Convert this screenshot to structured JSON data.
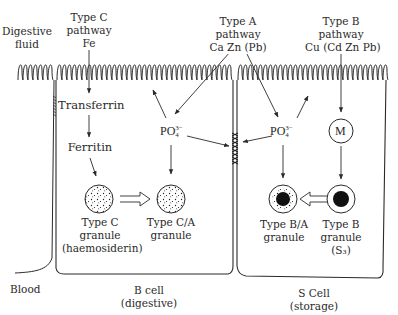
{
  "diagram": {
    "type": "cell-pathway-schematic",
    "labels": {
      "digestive_fluid": [
        "Digestive",
        "fluid"
      ],
      "type_c_pathway": [
        "Type C",
        "pathway",
        "Fe"
      ],
      "type_a_pathway": [
        "Type A",
        "pathway",
        "Ca Zn (Pb)"
      ],
      "type_b_pathway": [
        "Type B",
        "pathway",
        "Cu (Cd Zn Pb)"
      ],
      "transferrin": "Transferrin",
      "ferritin": "Ferritin",
      "phosphate_left": {
        "base": "PO",
        "sup": "3−",
        "sub": "4"
      },
      "phosphate_right": {
        "base": "PO",
        "sup": "3−",
        "sub": "4"
      },
      "metallothionein": "M",
      "type_c_granule": [
        "Type C",
        "granule",
        "(haemosiderin)"
      ],
      "type_ca_granule": [
        "Type C/A",
        "granule"
      ],
      "type_ba_granule": [
        "Type B/A",
        "granule"
      ],
      "type_b_granule": [
        "Type B",
        "granule",
        "(S₃)"
      ],
      "blood": "Blood",
      "b_cell": [
        "B cell",
        "(digestive)"
      ],
      "s_cell": [
        "S Cell",
        "(storage)"
      ]
    },
    "nodes": [
      {
        "id": "fe",
        "label": "Fe"
      },
      {
        "id": "transferrin",
        "label": "Transferrin"
      },
      {
        "id": "ferritin",
        "label": "Ferritin"
      },
      {
        "id": "c_granule",
        "label": "Type C granule (haemosiderin)"
      },
      {
        "id": "ca_granule",
        "label": "Type C/A granule"
      },
      {
        "id": "po4_b",
        "label": "PO4 3- (B cell)"
      },
      {
        "id": "po4_s",
        "label": "PO4 3- (S cell)"
      },
      {
        "id": "junction",
        "label": "cell junction"
      },
      {
        "id": "m",
        "label": "M"
      },
      {
        "id": "ba_granule",
        "label": "Type B/A granule"
      },
      {
        "id": "b_granule",
        "label": "Type B granule (S3)"
      }
    ],
    "edges": [
      {
        "from": "fe",
        "to": "transferrin"
      },
      {
        "from": "transferrin",
        "to": "ferritin"
      },
      {
        "from": "ferritin",
        "to": "c_granule"
      },
      {
        "from": "c_granule",
        "to": "ca_granule",
        "style": "hollow-double"
      },
      {
        "from": "type_a_pathway",
        "to": "po4_b"
      },
      {
        "from": "type_a_pathway",
        "to": "po4_s"
      },
      {
        "from": "po4_b",
        "to": "microvilli_b"
      },
      {
        "from": "po4_s",
        "to": "microvilli_s"
      },
      {
        "from": "po4_b",
        "to": "ca_granule"
      },
      {
        "from": "po4_b",
        "to": "junction"
      },
      {
        "from": "po4_s",
        "to": "junction"
      },
      {
        "from": "po4_s",
        "to": "ba_granule"
      },
      {
        "from": "type_b_pathway",
        "to": "m"
      },
      {
        "from": "m",
        "to": "b_granule"
      },
      {
        "from": "b_granule",
        "to": "ba_granule",
        "style": "hollow-double"
      }
    ],
    "colors": {
      "ink": "#2a2a2a",
      "background": "#ffffff",
      "granule_fill": "#111111"
    }
  }
}
